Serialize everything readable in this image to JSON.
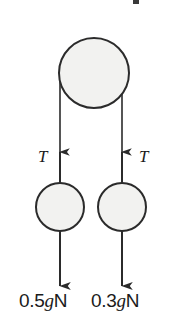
{
  "figure": {
    "background_color": "#ffffff",
    "line_color": "#2b2b2b",
    "fill_color": "#f2f2f0",
    "text_color": "#1b1b1b"
  },
  "pulley": {
    "name": "top-pulley",
    "cx": 94,
    "cy": 73,
    "r": 35
  },
  "masses": [
    {
      "name": "left-mass",
      "cx": 60,
      "cy": 207,
      "r": 24,
      "tension_label": "T",
      "weight_label_prefix": "0.5",
      "weight_label_italic": "g",
      "weight_label_suffix": "N",
      "weight_label_full": "0.5gN"
    },
    {
      "name": "right-mass",
      "cx": 122,
      "cy": 207,
      "r": 24,
      "tension_label": "T",
      "weight_label_prefix": "0.3",
      "weight_label_italic": "g",
      "weight_label_suffix": "N",
      "weight_label_full": "0.3gN"
    }
  ],
  "ropes": {
    "left_x": 60,
    "right_x": 122,
    "top_y": 73,
    "bottom_y": 183
  },
  "arrows": {
    "up_tip_y": 150,
    "down_tip_y": 288
  },
  "artifacts": {
    "scan_mark": "top-edge-scan-mark"
  }
}
